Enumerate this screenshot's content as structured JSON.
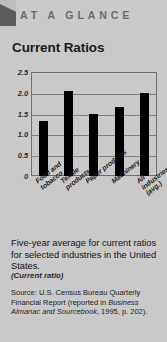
{
  "header": {
    "eyebrow": "AT A GLANCE",
    "title": "Current Ratios",
    "corner_icon": "corner-flag-icon"
  },
  "chart_data": {
    "type": "bar",
    "title": "Current Ratios",
    "categories": [
      "Food and\ntobacco",
      "Textile\nproducts",
      "Paper products",
      "Machinery",
      "All industries\n(avg.)"
    ],
    "values": [
      1.33,
      2.05,
      1.48,
      1.67,
      2.0
    ],
    "xlabel": "",
    "ylabel": "",
    "ylim": [
      0,
      2.5
    ],
    "yticks": [
      "0",
      "0.5",
      "1.0",
      "1.5",
      "2.0",
      "2.5"
    ],
    "ytick_values": [
      0,
      0.5,
      1.0,
      1.5,
      2.0,
      2.5
    ],
    "grid": true,
    "legend": "none",
    "bar_color": "#000000",
    "plot_background": "#c9c9c9"
  },
  "caption": {
    "text": "Five-year average for current ratios for selected industries in the United States.",
    "subtext": "(Current ratio)"
  },
  "source": {
    "prefix": "Source: U.S. Census Bureau Quarterly Financial Report (reported in ",
    "italic_title": "Business Almanac and Sourcebook",
    "suffix": ", 1995, p. 202)."
  },
  "colors": {
    "page_background": "#c9c9c9",
    "bar": "#000000",
    "eyebrow_text": "#6b6b6b",
    "frame": "#6f6f6f"
  }
}
